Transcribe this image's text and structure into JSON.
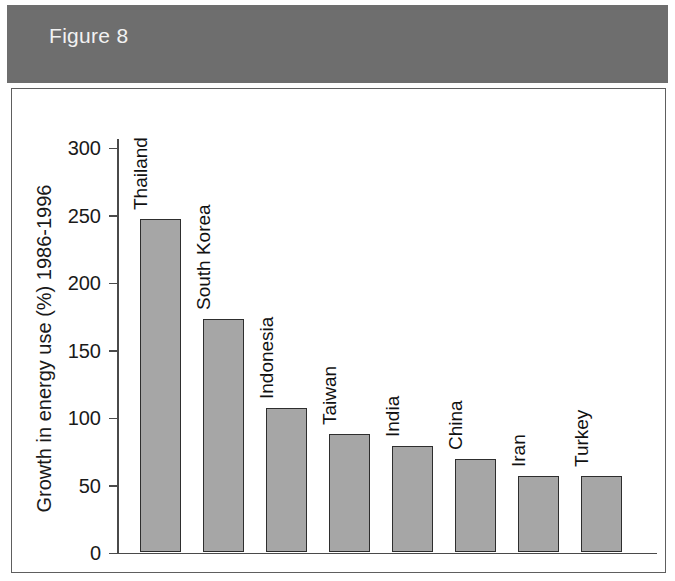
{
  "header": {
    "figure_label": "Figure 8",
    "band_color": "#6e6e6e",
    "text_color": "#f2f2f2"
  },
  "chart_data": {
    "type": "bar",
    "title": "Figure 8",
    "xlabel": "",
    "ylabel": "Growth in energy use (%) 1986-1996",
    "categories": [
      "Thailand",
      "South Korea",
      "Indonesia",
      "Taiwan",
      "India",
      "China",
      "Iran",
      "Turkey"
    ],
    "values": [
      247,
      173,
      107,
      88,
      79,
      69,
      57,
      57
    ],
    "ylim": [
      0,
      320
    ],
    "yticks": [
      0,
      50,
      100,
      150,
      200,
      250,
      300
    ],
    "ytick_labels": [
      "0",
      "50",
      "100",
      "150",
      "200",
      "250",
      "300"
    ],
    "grid": false,
    "legend": "none",
    "bar_fill_color": "#a6a6a6",
    "bar_edge_color": "#2e2e2e",
    "axis_color": "#4a4a4a",
    "label_rotation": 90
  }
}
